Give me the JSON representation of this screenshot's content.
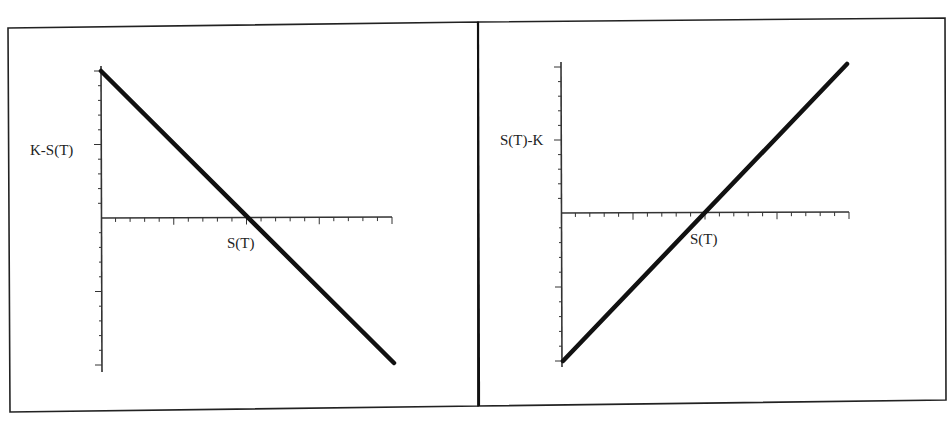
{
  "figure": {
    "frame_color": "#222222",
    "line_color": "#111111",
    "axis_color": "#333333"
  },
  "chart_data": [
    {
      "type": "line",
      "title": "",
      "xlabel": "S(T)",
      "ylabel": "K-S(T)",
      "description": "Payoff K - S(T): decreasing straight line crossing the horizontal axis at S(T)=K",
      "x_tick_count": 20,
      "y_tick_count_above": 7,
      "y_tick_count_below": 7,
      "series": [
        {
          "name": "K-S(T)",
          "x": [
            0,
            1,
            2
          ],
          "y": [
            1,
            0,
            -1
          ]
        }
      ],
      "xlim": [
        0,
        2
      ],
      "ylim": [
        -1,
        1
      ],
      "grid": false,
      "legend": "none",
      "layout": {
        "origin_px": [
          101,
          218
        ],
        "y_top_px": 66,
        "y_bottom_px": 372,
        "x_right_px": 392,
        "line_start_px": [
          101,
          71
        ],
        "line_end_px": [
          394,
          363
        ],
        "crossing_px": 248,
        "ylabel_px": [
          30,
          155
        ],
        "xlabel_px": [
          227,
          248
        ],
        "major_tick_y_px": [
          71,
          145,
          292,
          365
        ],
        "major_tick_x_px": [
          175,
          248,
          320,
          392
        ]
      }
    },
    {
      "type": "line",
      "title": "",
      "xlabel": "S(T)",
      "ylabel": "S(T)-K",
      "description": "Payoff S(T) - K: increasing straight line crossing the horizontal axis at S(T)=K",
      "x_tick_count": 20,
      "y_tick_count_above": 7,
      "y_tick_count_below": 7,
      "series": [
        {
          "name": "S(T)-K",
          "x": [
            0,
            1,
            2
          ],
          "y": [
            -1,
            0,
            1
          ]
        }
      ],
      "xlim": [
        0,
        2
      ],
      "ylim": [
        -1,
        1
      ],
      "grid": false,
      "legend": "none",
      "layout": {
        "origin_px": [
          561,
          213
        ],
        "y_top_px": 62,
        "y_bottom_px": 367,
        "x_right_px": 849,
        "line_start_px": [
          563,
          361
        ],
        "line_end_px": [
          847,
          64
        ],
        "crossing_px": 707,
        "ylabel_px": [
          500,
          145
        ],
        "xlabel_px": [
          690,
          244
        ],
        "major_tick_y_px": [
          67,
          140,
          287,
          361
        ],
        "major_tick_x_px": [
          634,
          707,
          778,
          849
        ]
      }
    }
  ]
}
